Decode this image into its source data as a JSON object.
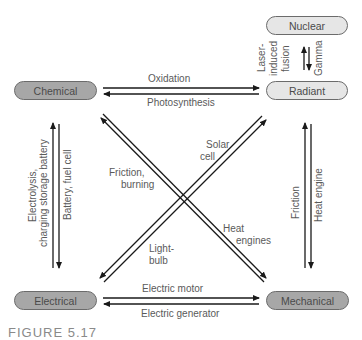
{
  "diagram": {
    "nodes": {
      "nuclear": "Nuclear",
      "chemical": "Chemical",
      "radiant": "Radiant",
      "electrical": "Electrical",
      "mechanical": "Mechanical"
    },
    "edges": {
      "chemical_to_radiant": "Oxidation",
      "radiant_to_chemical": "Photosynthesis",
      "radiant_to_nuclear_line1": "Laser-",
      "radiant_to_nuclear_line2": "induced",
      "radiant_to_nuclear_line3": "fusion",
      "nuclear_to_radiant": "Gamma",
      "electrical_to_chemical_line1": "Electrolysis,",
      "electrical_to_chemical_line2": "charging storage battery",
      "chemical_to_electrical": "Battery, fuel cell",
      "mechanical_to_radiant": "Friction",
      "radiant_to_mechanical": "Heat engine",
      "mechanical_to_chemical_line1": "Friction,",
      "mechanical_to_chemical_line2": "burning",
      "electrical_to_radiant_line1": "Solar",
      "electrical_to_radiant_line2": "cell",
      "radiant_to_electrical_line1": "Light-",
      "radiant_to_electrical_line2": "bulb",
      "chemical_to_mechanical_line1": "Heat",
      "chemical_to_mechanical_line2": "engines",
      "electrical_to_mechanical": "Electric motor",
      "mechanical_to_electrical": "Electric generator"
    },
    "caption": "FIGURE 5.17",
    "colors": {
      "dark_pill": "#a7a7a7",
      "light_pill": "#e6e6e6",
      "arrow": "#1a1a1a",
      "text": "#5a5a5a"
    }
  }
}
